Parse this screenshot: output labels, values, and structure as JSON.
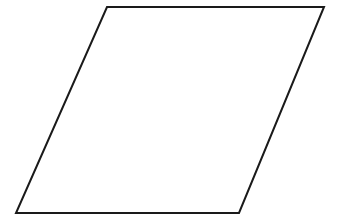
{
  "diagram": {
    "type": "parallelogram",
    "background": "#ffffff",
    "stroke": "#1a1a1a",
    "stroke_width": 2,
    "fill": "none",
    "vertices": [
      {
        "name": "top-left",
        "x": 107,
        "y": 7
      },
      {
        "name": "top-right",
        "x": 324,
        "y": 7
      },
      {
        "name": "bottom-right",
        "x": 239,
        "y": 213
      },
      {
        "name": "bottom-left",
        "x": 16,
        "y": 213
      }
    ],
    "labels": []
  }
}
